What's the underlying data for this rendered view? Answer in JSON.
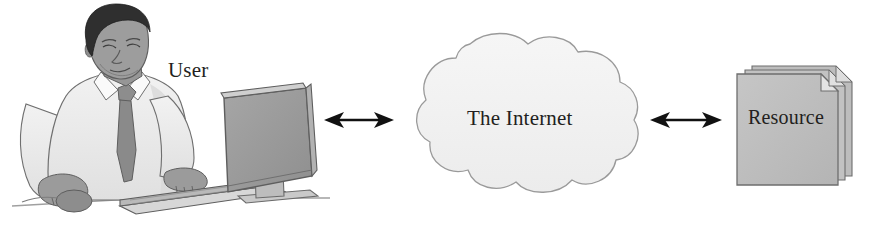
{
  "diagram": {
    "type": "network-flow",
    "orientation": "horizontal",
    "background_color": "#ffffff",
    "nodes": [
      {
        "id": "user",
        "label": "User",
        "icon": "person-at-computer-illustration",
        "shape": "illustration",
        "position": {
          "x": 0,
          "y": 0,
          "width": 320,
          "height": 231
        },
        "label_position": {
          "x": 168,
          "y": 58
        }
      },
      {
        "id": "internet",
        "label": "The Internet",
        "icon": "cloud-shape",
        "shape": "cloud",
        "fill_color": "#f1f1f1",
        "stroke_color": "#9a9a9a",
        "position": {
          "x": 424,
          "y": 38,
          "width": 210,
          "height": 158
        },
        "label_position": {
          "x": 467,
          "y": 106
        }
      },
      {
        "id": "resource",
        "label": "Resource",
        "icon": "document-stack-icon",
        "shape": "document-stack",
        "fill_color": "#bdbdbd",
        "stroke_color": "#6e6e6e",
        "page_count": 3,
        "position": {
          "x": 735,
          "y": 62,
          "width": 122,
          "height": 112
        },
        "label_position": {
          "x": 748,
          "y": 106
        }
      }
    ],
    "connectors": [
      {
        "id": "user-internet",
        "from": "user",
        "to": "internet",
        "style": "double-headed-arrow",
        "color": "#111111",
        "x1": 325,
        "x2": 392,
        "y": 120
      },
      {
        "id": "internet-resource",
        "from": "internet",
        "to": "resource",
        "style": "double-headed-arrow",
        "color": "#111111",
        "x1": 650,
        "x2": 722,
        "y": 120
      }
    ],
    "palette": {
      "ink": "#231f20",
      "outline": "#5c5c5c",
      "skin": "#9e9e9e",
      "hair": "#2e2e2e",
      "shirt": "#ededed",
      "shirt_shadow": "#d6d6d6",
      "tie": "#8a8a8a",
      "monitor": "#9d9d9d",
      "monitor_edge": "#7b7b7b",
      "cloud_fill": "#f1f1f1",
      "document_fill": "#c0c0c0",
      "arrow": "#111111",
      "desk_line": "#9a9a9a"
    }
  }
}
